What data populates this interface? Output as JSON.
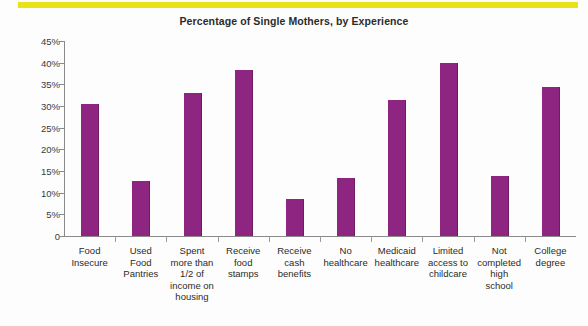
{
  "chart_data": {
    "type": "bar",
    "title": "Percentage of Single Mothers, by Experience",
    "xlabel": "",
    "ylabel": "",
    "ylim": [
      0,
      45
    ],
    "grid": false,
    "legend": "none",
    "y_tick_labels": [
      "45%",
      "40%",
      "35%",
      "30%",
      "25%",
      "20%",
      "15%",
      "10%",
      "5%",
      "0"
    ],
    "y_tick_values": [
      45,
      40,
      35,
      30,
      25,
      20,
      15,
      10,
      5,
      0
    ],
    "categories": [
      "Food Insecure",
      "Used Food Pantries",
      "Spent more than 1/2 of income on housing",
      "Receive food stamps",
      "Receive cash benefits",
      "No healthcare",
      "Medicaid healthcare",
      "Limited access to childcare",
      "Not completed high school",
      "College degree"
    ],
    "category_lines": [
      [
        "Food",
        "Insecure"
      ],
      [
        "Used",
        "Food",
        "Pantries"
      ],
      [
        "Spent",
        "more than",
        "1/2 of",
        "income on",
        "housing"
      ],
      [
        "Receive",
        "food",
        "stamps"
      ],
      [
        "Receive",
        "cash",
        "benefits"
      ],
      [
        "No",
        "healthcare"
      ],
      [
        "Medicaid",
        "healthcare"
      ],
      [
        "Limited",
        "access to",
        "childcare"
      ],
      [
        "Not",
        "completed",
        "high",
        "school"
      ],
      [
        "College",
        "degree"
      ]
    ],
    "values": [
      30.5,
      12.7,
      33.0,
      38.2,
      8.5,
      13.3,
      31.3,
      40.0,
      13.8,
      34.5
    ],
    "bar_color": "#8e2580",
    "accent_band_color": "#e8e216"
  }
}
